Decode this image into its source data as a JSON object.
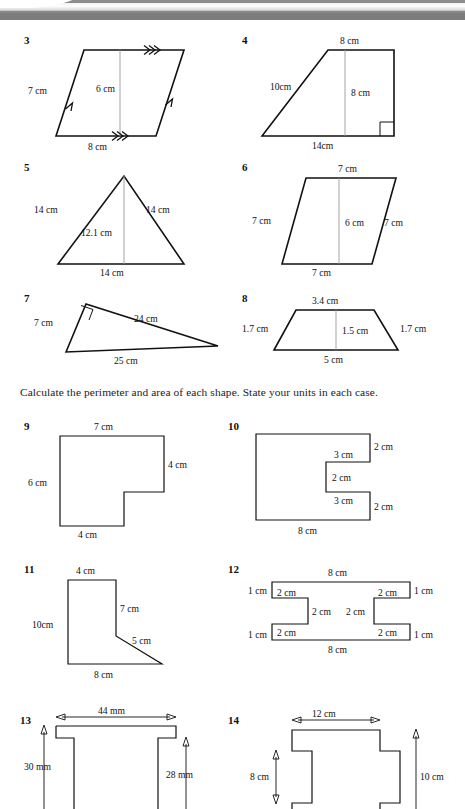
{
  "page": {
    "instruction": "Calculate the perimeter and area of each shape. State your units in each case.",
    "ink_color": "#111111",
    "guide_color": "#9a9a9a",
    "background": "#ffffff",
    "banner_color": "#8a8a8a"
  },
  "questions": [
    {
      "number": "3",
      "shape": "parallelogram",
      "labels": {
        "left_side": "7 cm",
        "height": "6 cm",
        "base": "8 cm",
        "top": "",
        "right_side": ""
      },
      "marks": "double-chevron on base and top, single-chevron on slanted sides"
    },
    {
      "number": "4",
      "shape": "right-trapezium",
      "labels": {
        "top": "8 cm",
        "slant_side": "10cm",
        "height": "8 cm",
        "base": "14cm"
      },
      "marks": "right-angle square at bottom-right"
    },
    {
      "number": "5",
      "shape": "isosceles-triangle",
      "labels": {
        "left_side": "14 cm",
        "right_side": "14 cm",
        "height": "12.1 cm",
        "base": "14 cm"
      }
    },
    {
      "number": "6",
      "shape": "parallelogram",
      "labels": {
        "top": "7 cm",
        "left_side": "7 cm",
        "height": "6 cm",
        "right_side": "7 cm",
        "base": "7 cm"
      }
    },
    {
      "number": "7",
      "shape": "right-triangle",
      "labels": {
        "left_side": "7 cm",
        "hypotenuse": "24 cm",
        "base": "25 cm"
      },
      "marks": "right-angle square at apex"
    },
    {
      "number": "8",
      "shape": "trapezium",
      "labels": {
        "top": "3.4 cm",
        "left_side": "1.7 cm",
        "height": "1.5 cm",
        "right_side": "1.7 cm",
        "base": "5 cm"
      }
    },
    {
      "number": "9",
      "shape": "L-shape",
      "labels": {
        "top": "7 cm",
        "right_side": "4 cm",
        "left_side": "6 cm",
        "base": "4 cm"
      }
    },
    {
      "number": "10",
      "shape": "C-shape",
      "labels": {
        "upper_right": "2 cm",
        "upper_notch_top": "3 cm",
        "notch_depth": "2 cm",
        "lower_notch_bottom": "3 cm",
        "lower_right": "2 cm",
        "base": "8 cm"
      }
    },
    {
      "number": "11",
      "shape": "angled-L-shape",
      "labels": {
        "top": "4 cm",
        "inner_right": "7 cm",
        "left_side": "10cm",
        "slant": "5 cm",
        "base": "8 cm"
      }
    },
    {
      "number": "12",
      "shape": "H-shape",
      "labels": {
        "top": "8 cm",
        "top_left_end": "1 cm",
        "top_left_arm": "2 cm",
        "left_web": "2 cm",
        "bottom_left_arm": "2 cm",
        "bottom_left_end": "1 cm",
        "top_right_arm": "2 cm",
        "top_right_end": "1 cm",
        "right_web": "2 cm",
        "bottom_right_arm": "2 cm",
        "bottom_right_end": "1 cm",
        "base": "8 cm"
      }
    },
    {
      "number": "13",
      "shape": "T-channel-profile",
      "labels": {
        "width": "44 mm",
        "left_height": "30 mm",
        "right_height": "28 mm"
      },
      "note": "cropped at page bottom"
    },
    {
      "number": "14",
      "shape": "notched-rectangle-profile",
      "labels": {
        "top_width": "12 cm",
        "left_height": "8 cm",
        "right_height": "10 cm"
      },
      "note": "cropped at page bottom"
    }
  ]
}
